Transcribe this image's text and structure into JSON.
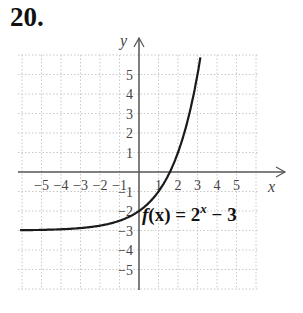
{
  "problem": {
    "number": "20."
  },
  "chart_data": {
    "type": "line",
    "title": "",
    "xlabel": "x",
    "ylabel": "y",
    "function_label": "f(x) = 2^x − 3",
    "function_label_parts": {
      "f": "f",
      "x": "(x)",
      "eq": " = 2",
      "exp": "x",
      "tail": " − 3"
    },
    "xlim": [
      -6,
      6
    ],
    "ylim": [
      -6,
      6
    ],
    "grid": true,
    "x_ticks": [
      "−5",
      "−4",
      "−3",
      "−2",
      "−1",
      "1",
      "2",
      "3",
      "4",
      "5"
    ],
    "y_ticks": [
      "5",
      "4",
      "3",
      "2",
      "1",
      "−1",
      "−2",
      "−3",
      "−4",
      "−5"
    ],
    "series": [
      {
        "name": "f(x) = 2^x − 3",
        "x": [
          -6,
          -5,
          -4,
          -3,
          -2,
          -1,
          0,
          1,
          1.585,
          2,
          2.5,
          3,
          3.17
        ],
        "y": [
          -2.98,
          -2.97,
          -2.94,
          -2.875,
          -2.75,
          -2.5,
          -2,
          -1,
          0,
          1,
          2.66,
          5,
          6
        ]
      }
    ],
    "asymptote": {
      "y": -3
    },
    "colors": {
      "curve": "#1a1a1a",
      "axis": "#555555",
      "grid": "#c8c8c8"
    }
  }
}
